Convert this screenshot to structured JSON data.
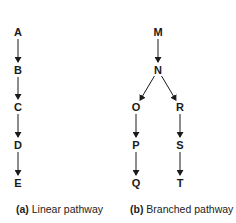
{
  "diagrams": [
    {
      "id": "linear",
      "caption_label": "(a)",
      "caption_text": "Linear pathway",
      "nodes": [
        {
          "id": "A",
          "label": "A",
          "x": 18,
          "y": 32
        },
        {
          "id": "B",
          "label": "B",
          "x": 18,
          "y": 70
        },
        {
          "id": "C",
          "label": "C",
          "x": 18,
          "y": 107
        },
        {
          "id": "D",
          "label": "D",
          "x": 18,
          "y": 145
        },
        {
          "id": "E",
          "label": "E",
          "x": 18,
          "y": 183
        }
      ],
      "edges": [
        [
          "A",
          "B"
        ],
        [
          "B",
          "C"
        ],
        [
          "C",
          "D"
        ],
        [
          "D",
          "E"
        ]
      ]
    },
    {
      "id": "branched",
      "caption_label": "(b)",
      "caption_text": "Branched pathway",
      "nodes": [
        {
          "id": "M",
          "label": "M",
          "x": 158,
          "y": 32
        },
        {
          "id": "N",
          "label": "N",
          "x": 158,
          "y": 70
        },
        {
          "id": "O",
          "label": "O",
          "x": 136,
          "y": 107
        },
        {
          "id": "R",
          "label": "R",
          "x": 180,
          "y": 107
        },
        {
          "id": "P",
          "label": "P",
          "x": 136,
          "y": 145
        },
        {
          "id": "S",
          "label": "S",
          "x": 180,
          "y": 145
        },
        {
          "id": "Q",
          "label": "Q",
          "x": 136,
          "y": 183
        },
        {
          "id": "T",
          "label": "T",
          "x": 180,
          "y": 183
        }
      ],
      "edges": [
        [
          "M",
          "N"
        ],
        [
          "N",
          "O"
        ],
        [
          "N",
          "R"
        ],
        [
          "O",
          "P"
        ],
        [
          "P",
          "Q"
        ],
        [
          "R",
          "S"
        ],
        [
          "S",
          "T"
        ]
      ]
    }
  ],
  "colors": {
    "ink": "#1a1a1a",
    "background": "#ffffff"
  }
}
